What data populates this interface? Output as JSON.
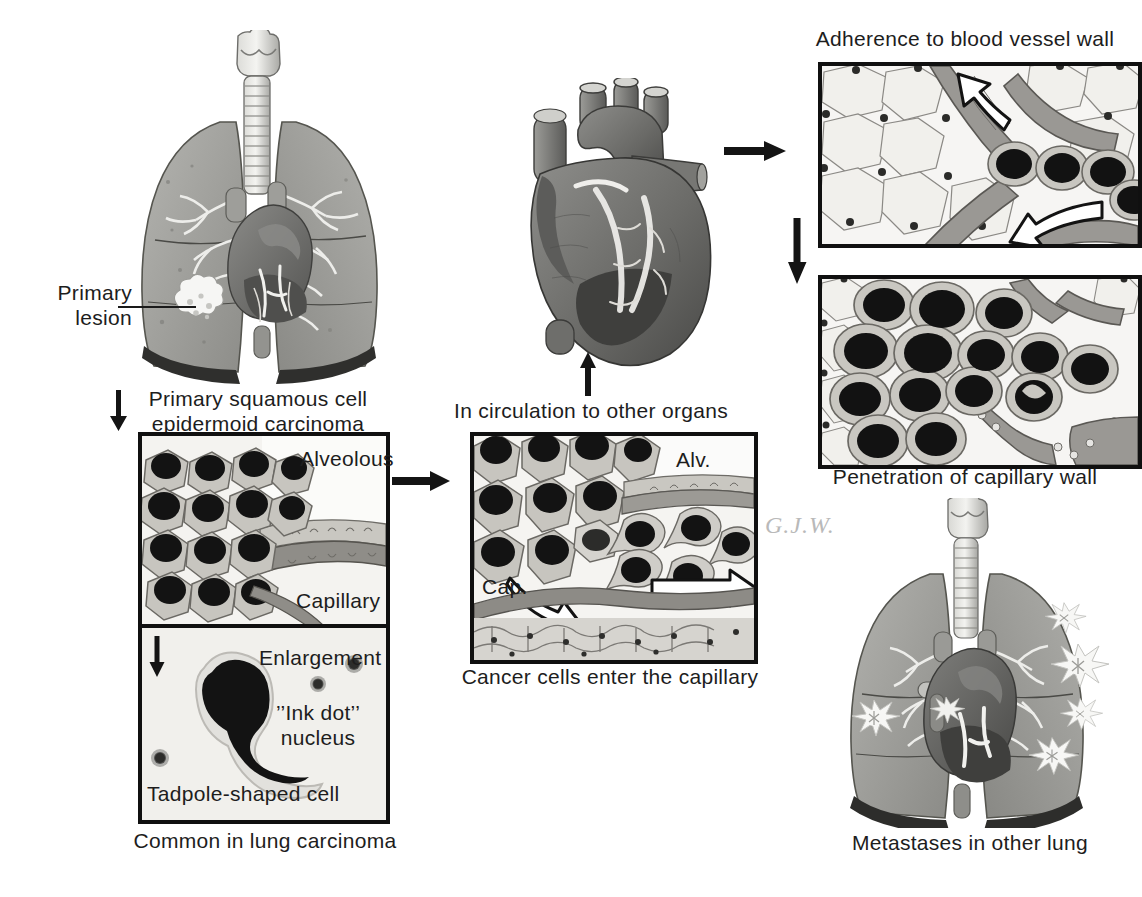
{
  "figure": {
    "signature": "G.J.W.",
    "palette": {
      "ink": "#1d1d1d",
      "panel_border": "#101010",
      "panel_bg": "#f2f1ee",
      "tissue_light": "#d9d7d2",
      "tissue_mid": "#9a9a96",
      "tissue_dark": "#5e5e5c",
      "nucleus": "#141414",
      "cytoplasm": "#b9b7b1",
      "lung": "#9c9c98",
      "lung_shadow": "#3a3a38",
      "heart": "#6f6f6d",
      "signature_gray": "#b9b9b9"
    }
  },
  "labels": {
    "primary_lesion": "Primary\nlesion",
    "primary_carcinoma": "Primary squamous cell\nepidermoid carcinoma",
    "alveolous": "Alveolous",
    "capillary": "Capillary",
    "enlargement": "Enlargement",
    "ink_dot_nucleus": "’’Ink dot’’\nnucleus",
    "tadpole_cell": "Tadpole-shaped cell",
    "common_in_lung": "Common in lung carcinoma",
    "in_circulation": "In circulation to other organs",
    "alv_short": "Alv.",
    "cap_short": "Cap.",
    "cancer_cells_enter": "Cancer cells enter the capillary",
    "adherence": "Adherence to blood vessel wall",
    "penetration": "Penetration of capillary wall",
    "metastases": "Metastases in other lung"
  },
  "panels": [
    {
      "id": "alveolar-capillary",
      "caption": "Alveolous / Capillary"
    },
    {
      "id": "enlargement",
      "caption": "Tadpole-shaped cell"
    },
    {
      "id": "cancer-cells-enter",
      "caption": "Cancer cells enter the capillary"
    },
    {
      "id": "adherence",
      "caption": "Adherence to blood vessel wall"
    },
    {
      "id": "penetration",
      "caption": "Penetration of capillary wall"
    }
  ],
  "flow": {
    "steps": [
      "Primary squamous cell epidermoid carcinoma",
      "Cancer cells enter the capillary",
      "In circulation to other organs",
      "Adherence to blood vessel wall",
      "Penetration of capillary wall",
      "Metastases in other lung"
    ],
    "arrows": [
      {
        "name": "arrow-lung-to-alveolus",
        "direction": "down"
      },
      {
        "name": "arrow-alveolus-to-capillary",
        "direction": "right"
      },
      {
        "name": "arrow-capillary-to-heart",
        "direction": "up"
      },
      {
        "name": "arrow-heart-to-adherence",
        "direction": "right"
      },
      {
        "name": "arrow-adherence-to-penetration",
        "direction": "down"
      },
      {
        "name": "arrow-enlargement",
        "direction": "down"
      }
    ]
  },
  "illustrations": [
    {
      "name": "lungs-with-primary-lesion",
      "caption": "Primary squamous cell epidermoid carcinoma"
    },
    {
      "name": "heart",
      "caption": "In circulation to other organs"
    },
    {
      "name": "lungs-with-metastases",
      "caption": "Metastases in other lung"
    }
  ]
}
